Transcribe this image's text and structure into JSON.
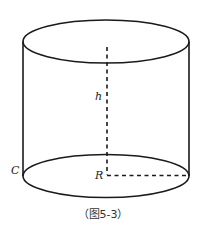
{
  "diagram": {
    "type": "cylinder",
    "labels": {
      "height": "h",
      "radius": "R",
      "circumference": "C"
    },
    "caption": "（图5-3）",
    "colors": {
      "stroke": "#1a1a1a",
      "background": "#ffffff"
    }
  }
}
